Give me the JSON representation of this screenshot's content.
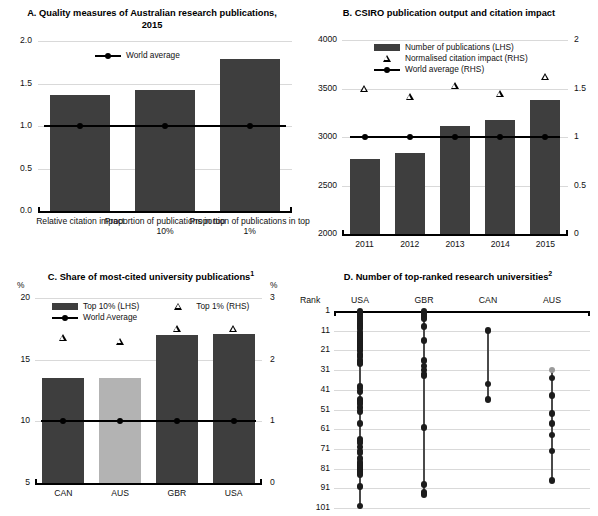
{
  "figure": {
    "cut_title": "......"
  },
  "panelA": {
    "title": "A. Quality measures of Australian research publications, 2015",
    "legend": [
      {
        "type": "line-dot",
        "label": "World average"
      }
    ],
    "chart_data": {
      "type": "bar",
      "title": "A. Quality measures of Australian research publications, 2015",
      "categories": [
        "Relative citation impact",
        "Proportion of publications in top 10%",
        "Proportion of publications in top 1%"
      ],
      "values": [
        1.37,
        1.42,
        1.79
      ],
      "series": [
        {
          "name": "Australia",
          "values": [
            1.37,
            1.42,
            1.79
          ]
        },
        {
          "name": "World average",
          "values": [
            1.0,
            1.0,
            1.0
          ]
        }
      ],
      "ylabel": "",
      "xlabel": "",
      "ylim": [
        0.0,
        2.0
      ],
      "yticks": [
        "0.0",
        "0.5",
        "1.0",
        "1.5",
        "2.0"
      ],
      "grid": true,
      "legend_position": "top-center"
    }
  },
  "panelB": {
    "title": "B. CSIRO publication output and citation impact",
    "legend": [
      {
        "type": "bar",
        "label": "Number of publications (LHS)"
      },
      {
        "type": "triangle",
        "label": "Normalised citation impact (RHS)"
      },
      {
        "type": "line-dot",
        "label": "World average (RHS)"
      }
    ],
    "chart_data": {
      "type": "bar",
      "title": "B. CSIRO publication output and citation impact",
      "categories": [
        "2011",
        "2012",
        "2013",
        "2014",
        "2015"
      ],
      "series": [
        {
          "name": "Number of publications (LHS)",
          "axis": "left",
          "values": [
            2770,
            2840,
            3110,
            3175,
            3380
          ]
        },
        {
          "name": "Normalised citation impact (RHS)",
          "axis": "right",
          "values": [
            1.5,
            1.42,
            1.53,
            1.45,
            1.62
          ]
        },
        {
          "name": "World average (RHS)",
          "axis": "right",
          "values": [
            1.0,
            1.0,
            1.0,
            1.0,
            1.0
          ]
        }
      ],
      "ylim": [
        2000,
        4000
      ],
      "yticks": [
        "2000",
        "2500",
        "3000",
        "3500",
        "4000"
      ],
      "y2lim": [
        0,
        2
      ],
      "y2ticks": [
        "0",
        "0.5",
        "1",
        "1.5",
        "2"
      ],
      "xlabel": "",
      "ylabel": "",
      "grid": true,
      "legend_position": "top-center"
    }
  },
  "panelC": {
    "title": "C. Share of most-cited university publications",
    "title_sup": "1",
    "unit_left": "%",
    "unit_right": "%",
    "legend": [
      {
        "type": "bar",
        "label": "Top 10% (LHS)"
      },
      {
        "type": "triangle",
        "label": "Top 1% (RHS)"
      },
      {
        "type": "line-dot",
        "label": "World Average"
      }
    ],
    "chart_data": {
      "type": "bar",
      "title": "C. Share of most-cited university publications",
      "categories": [
        "CAN",
        "AUS",
        "GBR",
        "USA"
      ],
      "series": [
        {
          "name": "Top 10% (LHS)",
          "axis": "left",
          "values": [
            13.5,
            13.5,
            17.0,
            17.1
          ]
        },
        {
          "name": "Top 1% (RHS)",
          "axis": "right",
          "values": [
            2.35,
            2.3,
            2.5,
            2.5
          ]
        },
        {
          "name": "World Average",
          "axis": "right",
          "values": [
            1.0,
            1.0,
            1.0,
            1.0
          ]
        }
      ],
      "highlight_category": "AUS",
      "ylim": [
        5,
        20
      ],
      "yticks": [
        "5",
        "10",
        "15",
        "20"
      ],
      "y2lim": [
        0,
        3
      ],
      "y2ticks": [
        "0",
        "1",
        "2",
        "3"
      ],
      "ylabel": "%",
      "y2label": "%",
      "xlabel": "",
      "grid": true,
      "legend_position": "top"
    }
  },
  "panelD": {
    "title": "D. Number of top-ranked research universities",
    "title_sup": "2",
    "rank_header": "Rank",
    "columns": [
      "USA",
      "GBR",
      "CAN",
      "AUS"
    ],
    "chart_data": {
      "type": "scatter",
      "title": "D. Number of top-ranked research universities",
      "xlabel": "",
      "ylabel": "Rank",
      "ylim": [
        1,
        101
      ],
      "yticks": [
        "1",
        "11",
        "21",
        "31",
        "41",
        "51",
        "61",
        "71",
        "81",
        "91",
        "101"
      ],
      "grid": true,
      "series": [
        {
          "name": "USA",
          "values": [
            1,
            2,
            3,
            4,
            5,
            6,
            7,
            8,
            9,
            10,
            12,
            13,
            14,
            15,
            16,
            17,
            18,
            19,
            20,
            21,
            23,
            24,
            26,
            27,
            28,
            39,
            40,
            42,
            46,
            47,
            48,
            50,
            52,
            58,
            66,
            67,
            68,
            70,
            72,
            73,
            76,
            78,
            79,
            80,
            81,
            82,
            83,
            84,
            90,
            100
          ]
        },
        {
          "name": "GBR",
          "values": [
            1,
            2,
            3,
            4,
            5,
            9,
            16,
            26,
            29,
            31,
            33,
            34,
            60,
            89,
            93,
            94
          ]
        },
        {
          "name": "CAN",
          "values": [
            11,
            38,
            46
          ]
        },
        {
          "name": "AUS",
          "values": [
            31,
            35,
            44,
            53,
            58,
            64,
            72,
            87
          ]
        }
      ],
      "highlight_point": {
        "series": "AUS",
        "value": 31
      }
    }
  }
}
